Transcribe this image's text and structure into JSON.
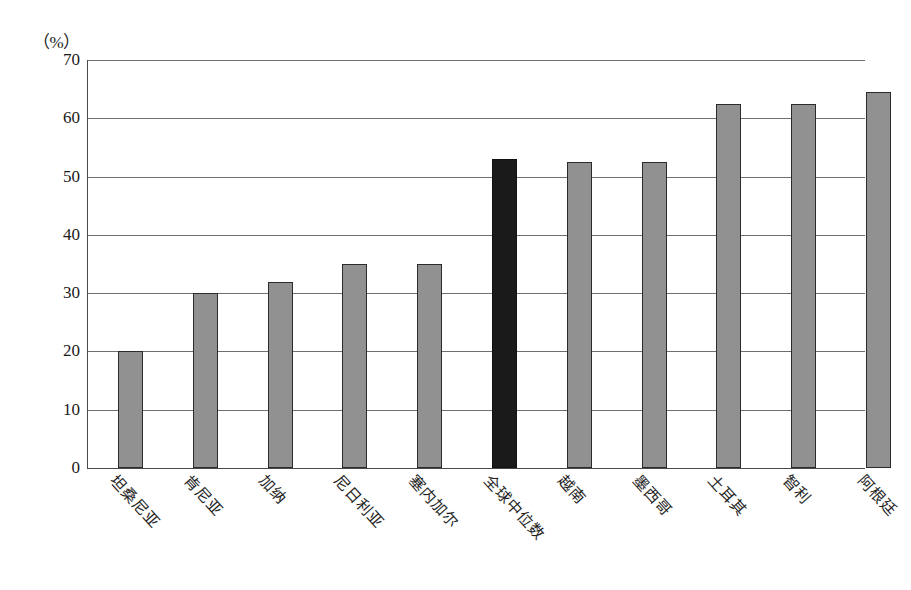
{
  "chart_data": {
    "type": "bar",
    "title": "",
    "subtitle": "",
    "xlabel": "",
    "ylabel": "",
    "unit_label": "（%）",
    "ylim": [
      0,
      70
    ],
    "ytick_step": 10,
    "yticks": [
      "70",
      "60",
      "50",
      "40",
      "30",
      "20",
      "10",
      "0"
    ],
    "ytick_values": [
      70,
      60,
      50,
      40,
      30,
      20,
      10,
      0
    ],
    "grid": true,
    "grid_orientation": "horizontal",
    "legend": "none",
    "categories": [
      "坦桑尼亚",
      "肯尼亚",
      "加纳",
      "尼日利亚",
      "塞内加尔",
      "全球中位数",
      "越南",
      "墨西哥",
      "土耳其",
      "智利",
      "阿根廷"
    ],
    "values": [
      20,
      30,
      32,
      35,
      35,
      53,
      52.5,
      52.5,
      62.5,
      62.5,
      64.5
    ],
    "highlight_index": 5,
    "highlight_category": "全球中位数",
    "bar_color": "#919191",
    "bar_border_color": "#2b2b2b",
    "highlight_color": "#1a1a1a",
    "grid_color": "#6f6f6f",
    "axis_color": "#4a4a4a",
    "background_color": "#ffffff"
  }
}
